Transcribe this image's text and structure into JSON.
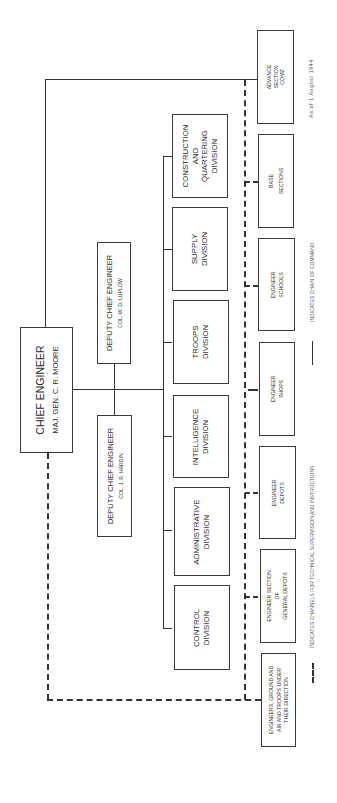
{
  "chart": {
    "date_note": "As of 1 August 1944",
    "chief": {
      "title": "CHIEF ENGINEER",
      "name": "MAJ. GEN. C. R. MOORE"
    },
    "deputies": [
      {
        "title": "DEPUTY CHIEF ENGINEER",
        "name": "COL. W. D. LUPLOW"
      },
      {
        "title": "DEPUTY CHIEF ENGINEER",
        "name": "COL. J. R. HARDIN"
      }
    ],
    "divisions": [
      {
        "line1": "CONSTRUCTION",
        "line2": "AND",
        "line3": "QUARTERING",
        "line4": "DIVISION"
      },
      {
        "line1": "SUPPLY",
        "line2": "DIVISION"
      },
      {
        "line1": "TROOPS",
        "line2": "DIVISION"
      },
      {
        "line1": "INTELLIGENCE",
        "line2": "DIVISION"
      },
      {
        "line1": "ADMINISTRATIVE",
        "line2": "DIVISION"
      },
      {
        "line1": "CONTROL",
        "line2": "DIVISION"
      }
    ],
    "field_units": [
      {
        "line1": "ADVANCE",
        "line2": "SECTION",
        "line3": "COMZ"
      },
      {
        "line1": "BASE",
        "line2": "SECTIONS"
      },
      {
        "line1": "ENGINEER",
        "line2": "SCHOOLS"
      },
      {
        "line1": "ENGINEER",
        "line2": "SHOPS"
      },
      {
        "line1": "ENGINEER",
        "line2": "DEPOTS"
      },
      {
        "line1": "ENGINEER SECTION",
        "line2": "OF",
        "line3": "GENERAL DEPOTS"
      },
      {
        "line1": "ENGINEERS, GROUND AND",
        "line2": "AIR AND TROOPS UNDER",
        "line3": "THEIR DIRECTION"
      }
    ],
    "legend": {
      "dashed": "INDICATES CHANNELS FOR TECHNICAL SUPERVISION AND INSTRUCTIONS",
      "solid": "INDICATES CHAIN OF COMMAND"
    }
  }
}
